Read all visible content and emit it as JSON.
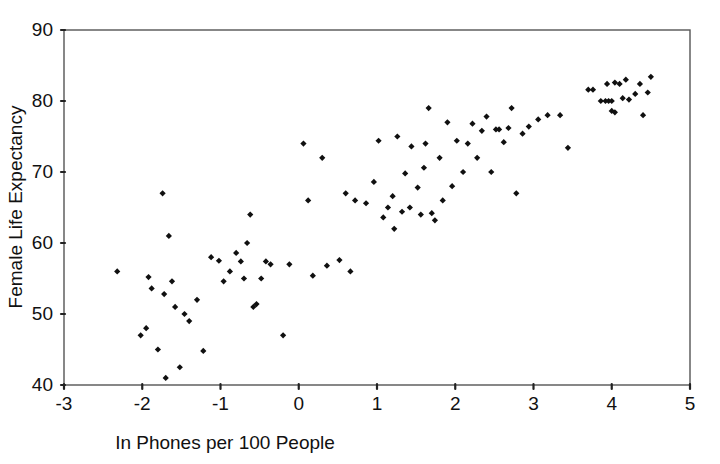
{
  "chart_data": {
    "type": "scatter",
    "title": "",
    "xlabel": "In Phones per 100 People",
    "ylabel": "Female Life Expectancy",
    "xlim": [
      -3,
      5
    ],
    "ylim": [
      40,
      90
    ],
    "xticks": [
      -3,
      -2,
      -1,
      0,
      1,
      2,
      3,
      4,
      5
    ],
    "xtick_labels": [
      "-3",
      "-2",
      "-1",
      "0",
      "1",
      "2",
      "3",
      "4",
      "5"
    ],
    "yticks": [
      40,
      50,
      60,
      70,
      80,
      90
    ],
    "ytick_labels": [
      "40",
      "50",
      "60",
      "70",
      "80",
      "90"
    ],
    "grid": false,
    "legend": false,
    "marker": "diamond",
    "marker_color": "#101010",
    "frame": true,
    "points": [
      [
        -2.32,
        56.0
      ],
      [
        -2.02,
        47.0
      ],
      [
        -1.95,
        48.0
      ],
      [
        -1.92,
        55.2
      ],
      [
        -1.88,
        53.6
      ],
      [
        -1.8,
        45.0
      ],
      [
        -1.74,
        67.0
      ],
      [
        -1.72,
        52.8
      ],
      [
        -1.7,
        41.0
      ],
      [
        -1.66,
        61.0
      ],
      [
        -1.62,
        54.6
      ],
      [
        -1.58,
        51.0
      ],
      [
        -1.52,
        42.5
      ],
      [
        -1.46,
        50.0
      ],
      [
        -1.4,
        49.0
      ],
      [
        -1.3,
        52.0
      ],
      [
        -1.22,
        44.8
      ],
      [
        -1.12,
        58.0
      ],
      [
        -1.02,
        57.5
      ],
      [
        -0.96,
        54.6
      ],
      [
        -0.88,
        56.0
      ],
      [
        -0.8,
        58.6
      ],
      [
        -0.74,
        57.4
      ],
      [
        -0.7,
        55.0
      ],
      [
        -0.66,
        60.0
      ],
      [
        -0.62,
        64.0
      ],
      [
        -0.58,
        51.0
      ],
      [
        -0.54,
        51.4
      ],
      [
        -0.48,
        55.0
      ],
      [
        -0.42,
        57.4
      ],
      [
        -0.36,
        57.0
      ],
      [
        -0.2,
        47.0
      ],
      [
        -0.12,
        57.0
      ],
      [
        0.06,
        74.0
      ],
      [
        0.12,
        66.0
      ],
      [
        0.18,
        55.4
      ],
      [
        0.3,
        72.0
      ],
      [
        0.36,
        56.8
      ],
      [
        0.52,
        57.6
      ],
      [
        0.6,
        67.0
      ],
      [
        0.66,
        56.0
      ],
      [
        0.72,
        66.0
      ],
      [
        0.86,
        65.6
      ],
      [
        0.96,
        68.6
      ],
      [
        1.02,
        74.4
      ],
      [
        1.08,
        63.6
      ],
      [
        1.14,
        65.0
      ],
      [
        1.2,
        66.6
      ],
      [
        1.22,
        62.0
      ],
      [
        1.26,
        75.0
      ],
      [
        1.32,
        64.4
      ],
      [
        1.36,
        69.8
      ],
      [
        1.42,
        65.0
      ],
      [
        1.44,
        73.6
      ],
      [
        1.52,
        67.8
      ],
      [
        1.56,
        64.0
      ],
      [
        1.6,
        70.6
      ],
      [
        1.62,
        74.0
      ],
      [
        1.66,
        79.0
      ],
      [
        1.7,
        64.2
      ],
      [
        1.74,
        63.2
      ],
      [
        1.8,
        72.0
      ],
      [
        1.84,
        66.0
      ],
      [
        1.9,
        77.0
      ],
      [
        1.96,
        68.0
      ],
      [
        2.02,
        74.4
      ],
      [
        2.1,
        70.0
      ],
      [
        2.16,
        74.0
      ],
      [
        2.22,
        76.8
      ],
      [
        2.28,
        72.0
      ],
      [
        2.34,
        75.8
      ],
      [
        2.4,
        77.8
      ],
      [
        2.46,
        70.0
      ],
      [
        2.52,
        76.0
      ],
      [
        2.56,
        76.0
      ],
      [
        2.62,
        74.2
      ],
      [
        2.68,
        76.2
      ],
      [
        2.72,
        79.0
      ],
      [
        2.78,
        67.0
      ],
      [
        2.86,
        75.4
      ],
      [
        2.94,
        76.4
      ],
      [
        3.06,
        77.4
      ],
      [
        3.18,
        78.0
      ],
      [
        3.34,
        78.0
      ],
      [
        3.44,
        73.4
      ],
      [
        3.7,
        81.6
      ],
      [
        3.76,
        81.6
      ],
      [
        3.86,
        80.0
      ],
      [
        3.92,
        80.0
      ],
      [
        3.96,
        80.0
      ],
      [
        4.0,
        80.0
      ],
      [
        3.94,
        82.4
      ],
      [
        4.04,
        82.6
      ],
      [
        4.0,
        78.6
      ],
      [
        4.04,
        78.4
      ],
      [
        4.1,
        82.4
      ],
      [
        4.14,
        80.4
      ],
      [
        4.18,
        83.0
      ],
      [
        4.22,
        80.2
      ],
      [
        4.3,
        81.0
      ],
      [
        4.36,
        82.4
      ],
      [
        4.4,
        78.0
      ],
      [
        4.46,
        81.2
      ],
      [
        4.5,
        83.4
      ]
    ]
  },
  "axis": {
    "x_title": "In Phones per 100 People",
    "y_title": "Female Life Expectancy"
  }
}
